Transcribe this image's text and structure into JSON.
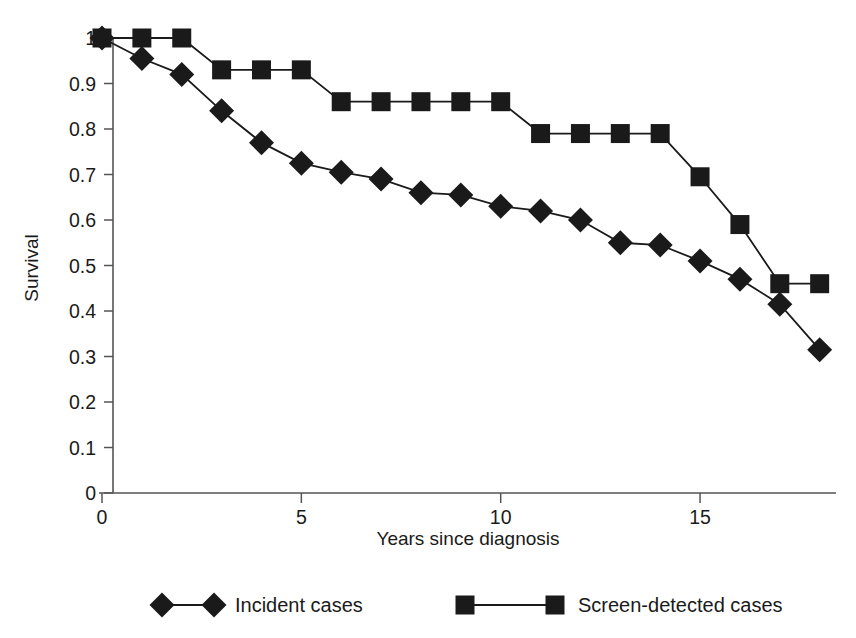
{
  "chart_data": {
    "type": "line",
    "title": "",
    "xlabel": "Years since diagnosis",
    "ylabel": "Survival",
    "xlim": [
      0,
      18.6
    ],
    "ylim": [
      0,
      1.0
    ],
    "grid": false,
    "legend_position": "bottom",
    "x_ticks": [
      {
        "value": 0,
        "label": "0"
      },
      {
        "value": 5,
        "label": "5"
      },
      {
        "value": 10,
        "label": "10"
      },
      {
        "value": 15,
        "label": "15"
      }
    ],
    "x_minor_ticks": [],
    "y_ticks": [
      {
        "value": 0,
        "label": "0"
      },
      {
        "value": 0.1,
        "label": "0.1"
      },
      {
        "value": 0.2,
        "label": "0.2"
      },
      {
        "value": 0.3,
        "label": "0.3"
      },
      {
        "value": 0.4,
        "label": "0.4"
      },
      {
        "value": 0.5,
        "label": "0.5"
      },
      {
        "value": 0.6,
        "label": "0.6"
      },
      {
        "value": 0.7,
        "label": "0.7"
      },
      {
        "value": 0.8,
        "label": "0.8"
      },
      {
        "value": 0.9,
        "label": "0.9"
      },
      {
        "value": 1.0,
        "label": "1"
      }
    ],
    "x": [
      0,
      1,
      2,
      3,
      4,
      5,
      6,
      7,
      8,
      9,
      10,
      11,
      12,
      13,
      14,
      15,
      16,
      17,
      18
    ],
    "series": [
      {
        "name": "Incident cases",
        "marker": "diamond",
        "color": "#1a1a1a",
        "values": [
          1.0,
          0.955,
          0.92,
          0.84,
          0.77,
          0.725,
          0.705,
          0.69,
          0.66,
          0.655,
          0.63,
          0.62,
          0.6,
          0.55,
          0.545,
          0.51,
          0.47,
          0.415,
          0.315
        ]
      },
      {
        "name": "Screen-detected cases",
        "marker": "square",
        "color": "#1a1a1a",
        "values": [
          1.0,
          1.0,
          1.0,
          0.93,
          0.93,
          0.93,
          0.86,
          0.86,
          0.86,
          0.86,
          0.86,
          0.79,
          0.79,
          0.79,
          0.79,
          0.695,
          0.59,
          0.46,
          0.46
        ]
      }
    ]
  },
  "legend": {
    "entries": [
      {
        "label": "Incident cases",
        "marker": "diamond"
      },
      {
        "label": "Screen-detected cases",
        "marker": "square"
      }
    ]
  }
}
